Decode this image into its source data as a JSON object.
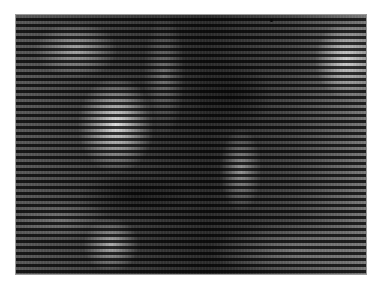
{
  "image": {
    "kind": "grayscale photograph with horizontal scan-line interference",
    "content": "blurred bright forms on dark background",
    "frame": {
      "left": 16,
      "top": 15,
      "width": 350,
      "height": 259
    },
    "colors": {
      "background": "#ffffff",
      "base": "#2a2a2a",
      "highlight": "#ebebeb",
      "border": "#9a9a9a"
    },
    "scanline_period_px": 6
  }
}
